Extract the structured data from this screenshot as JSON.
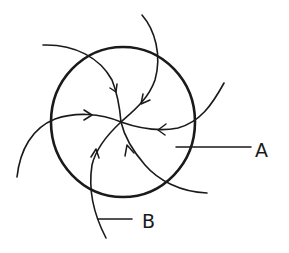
{
  "diagram": {
    "type": "hand-drawn sketch",
    "stroke_color": "#1a1a1a",
    "background_color": "#ffffff",
    "labels": [
      {
        "id": "A",
        "text": "A",
        "points_to": "interior region of circle (right side)"
      },
      {
        "id": "B",
        "text": "B",
        "points_to": "curved line exiting bottom of circle"
      }
    ],
    "center_point": {
      "x": 121,
      "y": 122
    },
    "circle": {
      "cx": 123,
      "cy": 122,
      "r": 72
    },
    "curves_count": 6,
    "arrow_direction": "inward toward center"
  }
}
